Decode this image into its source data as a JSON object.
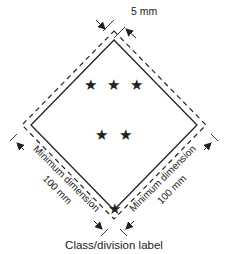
{
  "diagram": {
    "caption": "Class/division label",
    "border_width_label": "5 mm",
    "left_dimension": {
      "line1": "Minimum dimension",
      "line2": "100 mm"
    },
    "right_dimension": {
      "line1": "Minimum dimension",
      "line2": "100 mm"
    },
    "symbol": "★",
    "symbol_rows": [
      3,
      2,
      1
    ],
    "colors": {
      "line": "#222222",
      "background": "#ffffff"
    }
  }
}
